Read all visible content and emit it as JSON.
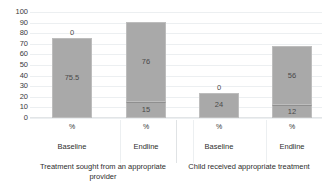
{
  "chart_data": {
    "type": "bar",
    "title": "",
    "subtitle": "",
    "xlabel": "",
    "ylabel": "",
    "ylim": [
      0,
      100
    ],
    "y_ticks": [
      100,
      90,
      80,
      70,
      60,
      50,
      40,
      30,
      20,
      10,
      0
    ],
    "grid": true,
    "legend": "none",
    "stacked": true,
    "bar_color": "#a9a9a9",
    "groups": [
      {
        "label": "Treatment sought from an appropriate provider",
        "bars": [
          {
            "phase": "Baseline",
            "unit": "%",
            "segments": [
              {
                "label": "0",
                "value": 0
              },
              {
                "label": "75.5",
                "value": 75.5
              }
            ],
            "total": 75.5
          },
          {
            "phase": "Endline",
            "unit": "%",
            "segments": [
              {
                "label": "15",
                "value": 15
              },
              {
                "label": "76",
                "value": 76
              }
            ],
            "total": 91
          }
        ]
      },
      {
        "label": "Child received appropriate treatment",
        "bars": [
          {
            "phase": "Baseline",
            "unit": "%",
            "segments": [
              {
                "label": "0",
                "value": 0
              },
              {
                "label": "24",
                "value": 24
              }
            ],
            "total": 24
          },
          {
            "phase": "Endline",
            "unit": "%",
            "segments": [
              {
                "label": "12",
                "value": 12
              },
              {
                "label": "56",
                "value": 56
              }
            ],
            "total": 68
          }
        ]
      }
    ]
  }
}
